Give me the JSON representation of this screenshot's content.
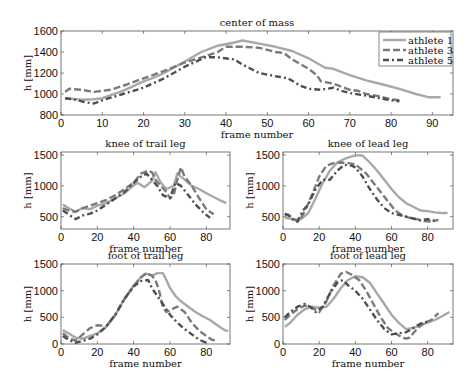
{
  "chart_data": [
    {
      "type": "line",
      "title": "center of mass",
      "xlabel": "frame number",
      "ylabel": "h [mm]",
      "xlim": [
        0,
        95
      ],
      "ylim": [
        800,
        1600
      ],
      "xticks": [
        0,
        10,
        20,
        30,
        40,
        50,
        60,
        70,
        80,
        90
      ],
      "yticks": [
        800,
        1000,
        1200,
        1400,
        1600
      ],
      "grid": false,
      "legend_position": "upper right",
      "box": {
        "x0": 61,
        "y0": 31,
        "x1": 453,
        "y1": 115
      },
      "series": [
        {
          "name": "athlete 1",
          "x": [
            1,
            5,
            8,
            10,
            15,
            20,
            22,
            25,
            30,
            34,
            38,
            42,
            44,
            48,
            52,
            56,
            60,
            64,
            66,
            70,
            74,
            78,
            82,
            86,
            89,
            92
          ],
          "y": [
            960,
            945,
            950,
            960,
            1030,
            1120,
            1150,
            1200,
            1310,
            1400,
            1460,
            1490,
            1510,
            1480,
            1450,
            1410,
            1340,
            1250,
            1240,
            1180,
            1130,
            1090,
            1050,
            1000,
            970,
            970
          ]
        },
        {
          "name": "athlete 3",
          "x": [
            1,
            2,
            5,
            8,
            12,
            16,
            20,
            25,
            30,
            35,
            38,
            40,
            44,
            48,
            52,
            54,
            56,
            60,
            62,
            63,
            66,
            68,
            70,
            72,
            74,
            77,
            80,
            82
          ],
          "y": [
            1020,
            1050,
            1040,
            1020,
            1040,
            1090,
            1150,
            1220,
            1300,
            1360,
            1400,
            1450,
            1450,
            1440,
            1400,
            1390,
            1330,
            1240,
            1180,
            1120,
            1100,
            1070,
            1040,
            1030,
            1000,
            980,
            950,
            940
          ]
        },
        {
          "name": "athlete 5",
          "x": [
            1,
            3,
            6,
            8,
            10,
            15,
            20,
            25,
            30,
            35,
            38,
            42,
            44,
            46,
            48,
            52,
            55,
            58,
            60,
            63,
            66,
            68,
            70,
            73,
            76,
            80,
            82
          ],
          "y": [
            960,
            950,
            920,
            910,
            940,
            1000,
            1060,
            1150,
            1260,
            1350,
            1350,
            1330,
            1280,
            1240,
            1200,
            1170,
            1150,
            1080,
            1050,
            1040,
            1060,
            1030,
            1010,
            990,
            970,
            940,
            930
          ]
        }
      ]
    },
    {
      "type": "line",
      "title": "knee of trail leg",
      "xlabel": "frame number",
      "ylabel": "h [mm]",
      "xlim": [
        0,
        93
      ],
      "ylim": [
        300,
        1550
      ],
      "xticks": [
        0,
        20,
        40,
        60,
        80
      ],
      "yticks": [
        500,
        1000,
        1500
      ],
      "box": {
        "x0": 61,
        "y0": 152,
        "x1": 230,
        "y1": 229
      },
      "series": [
        {
          "name": "athlete 1",
          "x": [
            1,
            4,
            8,
            12,
            16,
            20,
            25,
            30,
            35,
            38,
            42,
            46,
            50,
            52,
            55,
            58,
            62,
            64,
            66,
            68,
            72,
            76,
            80,
            84,
            88,
            91
          ],
          "y": [
            700,
            640,
            580,
            640,
            620,
            680,
            720,
            800,
            880,
            960,
            1050,
            980,
            1080,
            1220,
            1050,
            950,
            1000,
            1200,
            1150,
            1100,
            1000,
            950,
            880,
            820,
            760,
            720
          ]
        },
        {
          "name": "athlete 3",
          "x": [
            1,
            4,
            8,
            12,
            16,
            20,
            25,
            30,
            35,
            40,
            44,
            48,
            50,
            52,
            55,
            58,
            60,
            62,
            64,
            66,
            68,
            72,
            76,
            80,
            84
          ],
          "y": [
            640,
            600,
            580,
            640,
            680,
            720,
            770,
            850,
            950,
            1050,
            1200,
            1250,
            1220,
            1100,
            1000,
            900,
            800,
            850,
            1100,
            1300,
            1150,
            1000,
            800,
            620,
            540
          ]
        },
        {
          "name": "athlete 5",
          "x": [
            1,
            4,
            8,
            12,
            16,
            20,
            25,
            30,
            35,
            40,
            44,
            47,
            50,
            53,
            56,
            60,
            63,
            66,
            70,
            74,
            78,
            82
          ],
          "y": [
            600,
            540,
            460,
            520,
            550,
            600,
            700,
            800,
            900,
            1050,
            1150,
            1200,
            1100,
            1000,
            850,
            800,
            1050,
            1000,
            850,
            700,
            580,
            480
          ]
        }
      ]
    },
    {
      "type": "line",
      "title": "knee of lead leg",
      "xlabel": "frame number",
      "ylabel": "h [mm]",
      "xlim": [
        0,
        94
      ],
      "ylim": [
        300,
        1550
      ],
      "xticks": [
        0,
        20,
        40,
        60,
        80
      ],
      "yticks": [
        500,
        1000,
        1500
      ],
      "box": {
        "x0": 283,
        "y0": 152,
        "x1": 453,
        "y1": 229
      },
      "series": [
        {
          "name": "athlete 1",
          "x": [
            1,
            4,
            7,
            10,
            14,
            18,
            22,
            26,
            30,
            34,
            38,
            42,
            44,
            48,
            52,
            56,
            60,
            64,
            68,
            72,
            76,
            80,
            84,
            88,
            91
          ],
          "y": [
            480,
            470,
            450,
            460,
            560,
            800,
            1050,
            1250,
            1380,
            1440,
            1480,
            1500,
            1490,
            1380,
            1250,
            1100,
            950,
            820,
            720,
            660,
            600,
            590,
            570,
            560,
            560
          ]
        },
        {
          "name": "athlete 3",
          "x": [
            1,
            3,
            6,
            8,
            10,
            13,
            16,
            20,
            24,
            28,
            32,
            36,
            40,
            42,
            46,
            50,
            54,
            58,
            62,
            66,
            70,
            74,
            78,
            82,
            86
          ],
          "y": [
            520,
            530,
            460,
            420,
            480,
            650,
            850,
            1150,
            1330,
            1370,
            1380,
            1370,
            1350,
            1300,
            1200,
            1050,
            900,
            750,
            600,
            520,
            480,
            460,
            430,
            420,
            450
          ]
        },
        {
          "name": "athlete 5",
          "x": [
            1,
            3,
            6,
            8,
            11,
            14,
            18,
            22,
            26,
            30,
            34,
            38,
            40,
            44,
            48,
            52,
            56,
            60,
            64,
            68,
            72,
            76,
            80,
            84
          ],
          "y": [
            550,
            520,
            440,
            420,
            600,
            700,
            950,
            1100,
            1100,
            1250,
            1340,
            1330,
            1300,
            1150,
            950,
            780,
            640,
            560,
            530,
            500,
            470,
            440,
            460,
            430
          ]
        }
      ]
    },
    {
      "type": "line",
      "title": "foot of trail leg",
      "xlabel": "frame number",
      "ylabel": "h [mm]",
      "xlim": [
        0,
        93
      ],
      "ylim": [
        0,
        1500
      ],
      "xticks": [
        0,
        20,
        40,
        60,
        80
      ],
      "yticks": [
        0,
        500,
        1000,
        1500
      ],
      "box": {
        "x0": 61,
        "y0": 264,
        "x1": 230,
        "y1": 344
      },
      "series": [
        {
          "name": "athlete 1",
          "x": [
            1,
            4,
            8,
            12,
            16,
            20,
            25,
            30,
            35,
            40,
            44,
            47,
            50,
            53,
            56,
            58,
            60,
            63,
            66,
            70,
            74,
            78,
            82,
            86,
            90,
            92
          ],
          "y": [
            260,
            200,
            120,
            100,
            150,
            200,
            320,
            550,
            850,
            1100,
            1250,
            1320,
            1280,
            1330,
            1330,
            1200,
            1050,
            900,
            800,
            700,
            600,
            520,
            450,
            350,
            260,
            240
          ]
        },
        {
          "name": "athlete 3",
          "x": [
            1,
            4,
            8,
            12,
            16,
            20,
            25,
            30,
            35,
            40,
            44,
            47,
            50,
            52,
            54,
            56,
            58,
            61,
            64,
            68,
            72,
            76,
            80,
            83,
            86
          ],
          "y": [
            200,
            120,
            60,
            180,
            300,
            350,
            340,
            550,
            850,
            1080,
            1250,
            1330,
            1280,
            1200,
            1000,
            700,
            600,
            650,
            700,
            600,
            400,
            250,
            150,
            80,
            60
          ]
        },
        {
          "name": "athlete 5",
          "x": [
            1,
            4,
            8,
            12,
            16,
            20,
            25,
            30,
            35,
            40,
            44,
            48,
            50,
            53,
            56,
            60,
            64,
            68,
            72,
            76,
            80
          ],
          "y": [
            150,
            80,
            20,
            60,
            100,
            180,
            330,
            560,
            850,
            1080,
            1180,
            1200,
            1050,
            900,
            750,
            550,
            400,
            280,
            180,
            80,
            20
          ]
        }
      ]
    },
    {
      "type": "line",
      "title": "foot of lead leg",
      "xlabel": "frame number",
      "ylabel": "h [mm]",
      "xlim": [
        0,
        94
      ],
      "ylim": [
        0,
        1500
      ],
      "xticks": [
        0,
        20,
        40,
        60,
        80
      ],
      "yticks": [
        0,
        500,
        1000,
        1500
      ],
      "box": {
        "x0": 283,
        "y0": 264,
        "x1": 453,
        "y1": 344
      },
      "series": [
        {
          "name": "athlete 1",
          "x": [
            1,
            4,
            8,
            12,
            16,
            20,
            24,
            28,
            32,
            36,
            40,
            44,
            48,
            52,
            56,
            60,
            64,
            68,
            72,
            76,
            80,
            84,
            88,
            92
          ],
          "y": [
            320,
            400,
            550,
            650,
            700,
            680,
            700,
            850,
            1050,
            1200,
            1270,
            1250,
            1150,
            950,
            750,
            550,
            400,
            280,
            300,
            350,
            400,
            450,
            520,
            600
          ]
        },
        {
          "name": "athlete 3",
          "x": [
            1,
            4,
            8,
            12,
            16,
            20,
            24,
            28,
            32,
            35,
            38,
            42,
            46,
            50,
            54,
            58,
            62,
            66,
            68,
            70,
            74,
            78,
            82,
            86
          ],
          "y": [
            450,
            550,
            650,
            720,
            680,
            600,
            800,
            1100,
            1320,
            1350,
            1300,
            1200,
            1000,
            750,
            500,
            300,
            200,
            120,
            100,
            120,
            280,
            400,
            450,
            580
          ]
        },
        {
          "name": "athlete 5",
          "x": [
            1,
            4,
            8,
            12,
            15,
            18,
            22,
            26,
            30,
            33,
            36,
            40,
            44,
            48,
            52,
            56,
            60,
            64,
            68,
            72,
            76,
            80
          ],
          "y": [
            500,
            600,
            700,
            750,
            700,
            600,
            700,
            950,
            1150,
            1200,
            1100,
            1000,
            850,
            650,
            450,
            280,
            180,
            200,
            220,
            300,
            380,
            420
          ]
        }
      ]
    }
  ],
  "legend": {
    "items": [
      {
        "label": "athlete 1",
        "color": "#a8a8a8",
        "style": "solid"
      },
      {
        "label": "athlete 3",
        "color": "#7a7a7a",
        "style": "dashed"
      },
      {
        "label": "athlete 5",
        "color": "#4e4e4e",
        "style": "dash-dot"
      }
    ]
  },
  "styles": {
    "athlete 1": {
      "color": "#a8a8a8",
      "dash": ""
    },
    "athlete 3": {
      "color": "#7a7a7a",
      "dash": "7,3"
    },
    "athlete 5": {
      "color": "#4e4e4e",
      "dash": "6,3,2,3"
    }
  }
}
